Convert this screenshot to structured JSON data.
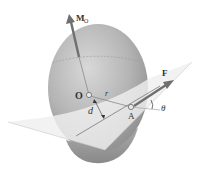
{
  "diagram": {
    "labels": {
      "moment": "M",
      "moment_sub": "O",
      "origin": "O",
      "position": "r",
      "distance": "d",
      "point": "A",
      "force": "F",
      "angle": "θ"
    },
    "colors": {
      "sphere": "#a9a9a9",
      "sphere_light": "#d4d4d4",
      "plane": "#ededed",
      "vector": "#6f6f6f",
      "text": "#333333"
    }
  }
}
